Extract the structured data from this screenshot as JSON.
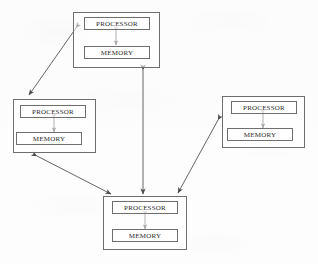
{
  "diagram": {
    "line_color": "#555555",
    "text_color": "#2c2c2c",
    "background_color": "#fdfdfd",
    "nodes": [
      {
        "id": "top",
        "name": "node-top",
        "processor_label": "PROCESSOR",
        "memory_label": "MEMORY",
        "x": 73,
        "y": 12,
        "w": 87,
        "h": 56
      },
      {
        "id": "left",
        "name": "node-left",
        "processor_label": "PROCESSOR",
        "memory_label": "MEMORY",
        "x": 13,
        "y": 99,
        "w": 83,
        "h": 54
      },
      {
        "id": "right",
        "name": "node-right",
        "processor_label": "PROCESSOR",
        "memory_label": "MEMORY",
        "x": 222,
        "y": 96,
        "w": 83,
        "h": 52
      },
      {
        "id": "bottom",
        "name": "node-bottom",
        "processor_label": "PROCESSOR",
        "memory_label": "MEMORY",
        "x": 103,
        "y": 196,
        "w": 84,
        "h": 54
      }
    ],
    "internal_links": [
      {
        "from": "top-processor",
        "to": "top-memory",
        "arrowheads": "both"
      },
      {
        "from": "left-processor",
        "to": "left-memory",
        "arrowheads": "both"
      },
      {
        "from": "right-processor",
        "to": "right-memory",
        "arrowheads": "both"
      },
      {
        "from": "bottom-processor",
        "to": "bottom-memory",
        "arrowheads": "both"
      }
    ],
    "network_links": [
      {
        "id": "top-left",
        "from": "top",
        "to": "left",
        "arrowheads": "both"
      },
      {
        "id": "top-bottom",
        "from": "top",
        "to": "bottom",
        "arrowheads": "both"
      },
      {
        "id": "left-bottom",
        "from": "left",
        "to": "bottom",
        "arrowheads": "both"
      },
      {
        "id": "right-bottom",
        "from": "right",
        "to": "bottom",
        "arrowheads": "both"
      }
    ]
  }
}
